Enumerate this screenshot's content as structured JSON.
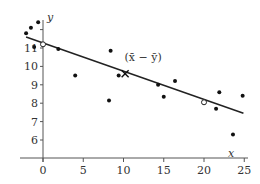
{
  "chart_data": {
    "type": "scatter",
    "title": "",
    "xlabel": "x",
    "ylabel": "y",
    "xlim": [
      -3,
      25.5
    ],
    "ylim": [
      5.2,
      12.8
    ],
    "x_ticks": [
      0,
      5,
      10,
      15,
      20,
      25
    ],
    "y_ticks": [
      6,
      7,
      8,
      9,
      10,
      11
    ],
    "x_tick_labels": [
      "0",
      "5",
      "10",
      "15",
      "20",
      "25"
    ],
    "y_tick_labels": [
      "6",
      "7",
      "8",
      "9",
      "10",
      "11"
    ],
    "grid": false,
    "legend": null,
    "series": [
      {
        "name": "observations",
        "marker": "filled-dot",
        "points": [
          {
            "x": -2.1,
            "y": 11.8
          },
          {
            "x": -1.5,
            "y": 12.1
          },
          {
            "x": -0.6,
            "y": 12.4
          },
          {
            "x": -1.1,
            "y": 11.05
          },
          {
            "x": 1.9,
            "y": 10.95
          },
          {
            "x": 4.0,
            "y": 9.5
          },
          {
            "x": 8.4,
            "y": 10.85
          },
          {
            "x": 8.2,
            "y": 8.15
          },
          {
            "x": 9.4,
            "y": 9.5
          },
          {
            "x": 14.3,
            "y": 9.0
          },
          {
            "x": 15.0,
            "y": 8.35
          },
          {
            "x": 16.4,
            "y": 9.2
          },
          {
            "x": 21.9,
            "y": 8.6
          },
          {
            "x": 21.5,
            "y": 7.7
          },
          {
            "x": 23.6,
            "y": 6.3
          },
          {
            "x": 24.8,
            "y": 8.4
          }
        ]
      },
      {
        "name": "line-points",
        "marker": "open-circle",
        "points": [
          {
            "x": 0,
            "y": 11.2
          },
          {
            "x": 20,
            "y": 8.05
          }
        ]
      },
      {
        "name": "mean-point",
        "marker": "cross",
        "points": [
          {
            "x": 10.2,
            "y": 9.6
          }
        ]
      }
    ],
    "regression_line": {
      "x_start": -2.1,
      "y_start": 11.6,
      "x_end": 24.9,
      "y_end": 7.45
    },
    "annotations": [
      {
        "text": "(x̄ − ȳ)",
        "x": 10.5,
        "y": 10.3
      }
    ]
  }
}
